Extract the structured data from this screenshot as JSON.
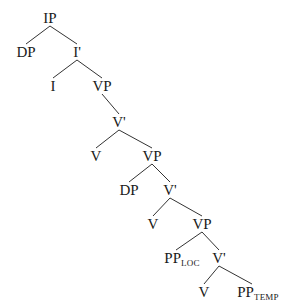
{
  "diagram": {
    "type": "syntax-tree",
    "nodes": [
      {
        "id": "n0",
        "label": "IP",
        "sub": "",
        "x": 50,
        "y": 18
      },
      {
        "id": "n1",
        "label": "DP",
        "sub": "",
        "x": 26,
        "y": 52
      },
      {
        "id": "n2",
        "label": "I'",
        "sub": "",
        "x": 77,
        "y": 52
      },
      {
        "id": "n3",
        "label": "I",
        "sub": "",
        "x": 53,
        "y": 86
      },
      {
        "id": "n4",
        "label": "VP",
        "sub": "",
        "x": 102,
        "y": 86
      },
      {
        "id": "n5",
        "label": "V'",
        "sub": "",
        "x": 119,
        "y": 122
      },
      {
        "id": "n6",
        "label": "V",
        "sub": "",
        "x": 96,
        "y": 156
      },
      {
        "id": "n7",
        "label": "VP",
        "sub": "",
        "x": 152,
        "y": 156
      },
      {
        "id": "n8",
        "label": "DP",
        "sub": "",
        "x": 129,
        "y": 190
      },
      {
        "id": "n9",
        "label": "V'",
        "sub": "",
        "x": 170,
        "y": 190
      },
      {
        "id": "n10",
        "label": "V",
        "sub": "",
        "x": 153,
        "y": 224
      },
      {
        "id": "n11",
        "label": "VP",
        "sub": "",
        "x": 202,
        "y": 224
      },
      {
        "id": "n12",
        "label": "PP",
        "sub": "LOC",
        "x": 182,
        "y": 258
      },
      {
        "id": "n13",
        "label": "V'",
        "sub": "",
        "x": 219,
        "y": 258
      },
      {
        "id": "n14",
        "label": "V",
        "sub": "",
        "x": 204,
        "y": 292
      },
      {
        "id": "n15",
        "label": "PP",
        "sub": "TEMP",
        "x": 258,
        "y": 292
      }
    ],
    "edges": [
      [
        "n0",
        "n1"
      ],
      [
        "n0",
        "n2"
      ],
      [
        "n2",
        "n3"
      ],
      [
        "n2",
        "n4"
      ],
      [
        "n4",
        "n5"
      ],
      [
        "n5",
        "n6"
      ],
      [
        "n5",
        "n7"
      ],
      [
        "n7",
        "n8"
      ],
      [
        "n7",
        "n9"
      ],
      [
        "n9",
        "n10"
      ],
      [
        "n9",
        "n11"
      ],
      [
        "n11",
        "n12"
      ],
      [
        "n11",
        "n13"
      ],
      [
        "n13",
        "n14"
      ],
      [
        "n13",
        "n15"
      ]
    ]
  }
}
